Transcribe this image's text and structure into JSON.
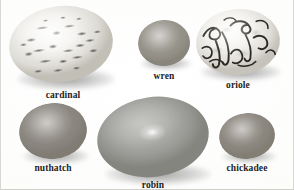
{
  "plate": {
    "title": "Bird egg comparison plate",
    "background_color": "#fbfbfa"
  },
  "specimens": [
    {
      "label": "cardinal",
      "icon": "egg-icon",
      "row": 1,
      "column": 1,
      "size": "large",
      "pattern": "heavily blotched with dark brown speckles over pale ground",
      "base_color": "#f2f1ee",
      "mark_color": "#4d4a44"
    },
    {
      "label": "wren",
      "icon": "egg-icon",
      "row": 1,
      "column": 2,
      "size": "small",
      "pattern": "finely stippled, uniform dull grey-brown",
      "base_color": "#e3e1db",
      "mark_color": "#6d6960"
    },
    {
      "label": "oriole",
      "icon": "egg-icon",
      "row": 1,
      "column": 3,
      "size": "medium-large",
      "pattern": "pale ground with bold dark scrawled lines",
      "base_color": "#f3f2ef",
      "mark_color": "#2b2823"
    },
    {
      "label": "nuthatch",
      "icon": "egg-icon",
      "row": 2,
      "column": 1,
      "size": "medium",
      "pattern": "dense fine speckling concentrated toward the edges",
      "base_color": "#eceae4",
      "mark_color": "#65615a"
    },
    {
      "label": "robin",
      "icon": "egg-icon",
      "row": 2,
      "column": 2,
      "size": "largest",
      "pattern": "smooth and unmarked with a bright specular highlight",
      "base_color": "#acaca9",
      "mark_color": "none"
    },
    {
      "label": "chickadee",
      "icon": "egg-icon",
      "row": 2,
      "column": 3,
      "size": "small",
      "pattern": "fine reddish-grey speckles on white ground",
      "base_color": "#f0eee9",
      "mark_color": "#6f6a61"
    }
  ]
}
